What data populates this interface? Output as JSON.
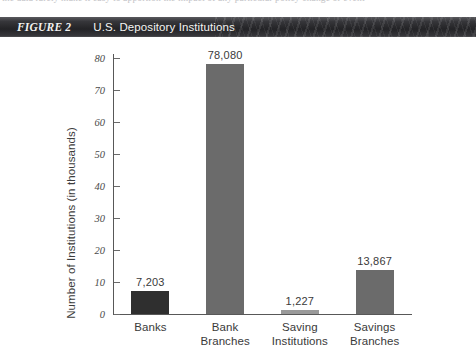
{
  "page": {
    "clipped_top_line": "the data rarely make it easy to apportion the impact of any particular policy change or event"
  },
  "figure_header": {
    "figure_number": "FIGURE 2",
    "title": "U.S. Depository Institutions"
  },
  "chart_data": {
    "type": "bar",
    "title": "U.S. Depository Institutions",
    "xlabel": "",
    "ylabel": "Number of Institutions (in thousands)",
    "categories": [
      "Banks",
      "Bank\nBranches",
      "Saving\nInstitutions",
      "Savings\nBranches"
    ],
    "values": [
      7.203,
      78.08,
      1.227,
      13.867
    ],
    "value_labels": [
      "7,203",
      "78,080",
      "1,227",
      "13,867"
    ],
    "bar_colors": [
      "#2f2f2f",
      "#6b6b6b",
      "#9a9a9a",
      "#6b6b6b"
    ],
    "ylim": [
      0,
      80
    ],
    "yticks": [
      0,
      10,
      20,
      30,
      40,
      50,
      60,
      70,
      80
    ],
    "ytick_labels": [
      "0",
      "10",
      "20",
      "30",
      "40",
      "50",
      "60",
      "70",
      "80"
    ],
    "grid": false,
    "legend": "none"
  }
}
